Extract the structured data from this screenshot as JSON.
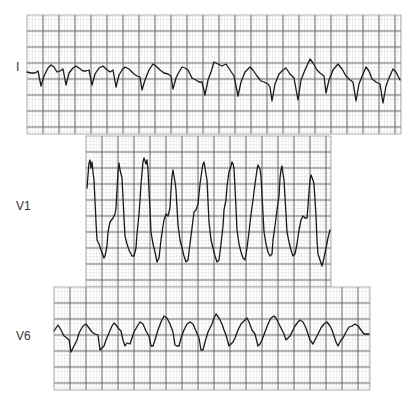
{
  "figure": {
    "background": "#ffffff",
    "grid": {
      "minor_size_px": 3.2,
      "major_size_px": 16,
      "minor_color": "#c8c8c8",
      "major_color": "#5a5a5a",
      "paper_color": "#ffffff"
    },
    "trace_color": "#1a1a1a"
  },
  "leads": [
    {
      "label": "I",
      "label_pos": {
        "x": 16,
        "y": 61
      },
      "strip": {
        "x": 27,
        "y": 15,
        "w": 374,
        "h": 119
      },
      "points": "27,72 31,73 35,73 38,71 41,86 44,76 48,68 51,65 54,67 57,72 60,71 63,69 66,85 69,73 73,68 76,66 79,68 83,71 86,71 89,70 92,85 95,74 99,68 103,66 106,69 110,72 113,70 116,87 119,75 122,70 125,67 129,69 134,74 137,76 140,77 142,90 145,80 149,70 153,64 156,66 160,70 164,73 168,74 171,76 173,89 176,78 179,72 182,67 185,68 188,70 192,78 196,80 199,82 202,82 205,95 208,80 211,72 214,62 218,64 222,66 226,64 230,70 234,76 238,96 241,82 245,72 250,67 253,70 257,76 261,81 264,82 268,84 270,87 272,101 275,84 279,74 283,70 286,68 290,74 294,78 298,100 301,80 305,70 310,59 313,63 317,70 320,73 324,76 326,93 329,80 333,70 338,64 342,69 346,76 350,80 353,82 356,101 359,84 363,74 366,67 369,71 372,79 376,82 380,84 383,103 386,86 389,78 393,69 396,72 400,80"
    },
    {
      "label": "V1",
      "label_pos": {
        "x": 16,
        "y": 200
      },
      "strip": {
        "x": 86,
        "y": 136,
        "w": 245,
        "h": 151
      },
      "points": "87,188 88,175 89,163 90,160 91,168 92,162 93,172 94,180 96,222 97,240 99,244 101,250 104,258 105,256 107,246 108,232 110,222 113,218 115,214 116,208 117,190 118,172 119,163 120,170 121,174 122,178 124,218 125,236 127,244 129,250 132,256 134,256 136,248 137,234 139,214 140,200 141,184 143,162 144,158 146,164 147,160 148,170 150,210 151,232 153,244 155,252 157,262 159,258 161,240 163,226 164,220 166,214 168,216 170,208 171,190 172,176 173,170 175,182 176,190 178,225 180,240 182,248 184,256 186,262 188,260 190,244 192,228 194,212 196,210 198,204 200,184 202,170 203,164 204,162 206,174 207,180 209,222 211,240 213,248 215,256 217,262 219,260 221,244 223,226 224,210 226,200 227,186 229,172 231,166 232,162 233,164 234,168 236,208 237,230 239,244 241,252 243,258 245,260 247,248 249,232 251,214 253,200 255,184 257,170 258,165 260,169 261,176 263,214 264,232 266,244 268,252 270,256 272,254 273,240 275,226 277,210 279,196 280,178 281,170 282,166 283,174 284,180 286,214 287,232 289,242 291,250 293,256 295,254 297,244 299,230 301,220 303,216 305,218 307,218 308,206 309,192 310,180 311,175 313,180 314,184 316,216 317,240 318,254 320,260 322,266 324,258 326,248 328,238 330,230"
    },
    {
      "label": "V6",
      "label_pos": {
        "x": 16,
        "y": 330
      },
      "strip": {
        "x": 54,
        "y": 287,
        "w": 316,
        "h": 103
      },
      "points": "54,331 56,328 58,325 61,330 64,336 67,338 69,340 71,352 73,348 75,344 77,340 79,333 83,326 86,324 89,328 92,332 95,334 98,335 100,350 102,348 104,346 106,340 109,333 112,326 114,323 116,325 119,329 121,331 123,340 125,346 127,343 130,344 132,338 134,332 138,325 140,322 143,324 146,331 149,336 151,346 153,346 155,340 158,330 161,322 164,316 167,318 170,324 173,332 175,345 177,346 179,346 181,338 184,330 187,324 190,322 193,324 196,331 199,338 201,350 203,350 205,342 208,332 212,324 214,318 216,314 219,318 222,324 224,330 226,335 229,346 231,344 233,342 235,338 238,330 241,324 244,321 247,318 249,322 252,330 255,334 258,346 260,344 262,340 265,332 268,324 271,318 274,316 276,318 279,324 282,330 284,334 286,340 288,338 290,336 292,332 295,326 298,322 300,320 303,322 306,328 308,334 310,340 313,344 315,340 318,334 321,328 324,324 327,322 330,326 332,330 334,336 336,342 338,346 341,340 343,338 346,332 349,327 352,326 355,324 358,326 361,330 364,334 367,334 369,334"
    }
  ]
}
